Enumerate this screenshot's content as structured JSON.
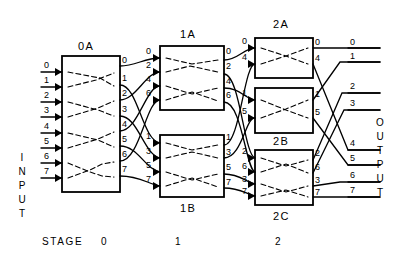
{
  "diagram": {
    "title_labels": {
      "input_word": "INPUT",
      "output_word": "OUTPUT",
      "stage_word": "STAGE"
    },
    "stage_numbers": [
      "0",
      "1",
      "2"
    ],
    "input_ports": [
      "0",
      "1",
      "2",
      "3",
      "4",
      "5",
      "6",
      "7"
    ],
    "output_ports": [
      "0",
      "1",
      "2",
      "3",
      "4",
      "5",
      "6",
      "7"
    ],
    "switches": [
      {
        "name": "0A",
        "label_position": "top",
        "stage": 0,
        "in_labels": [
          "0",
          "1",
          "2",
          "3",
          "4",
          "5",
          "6",
          "7"
        ],
        "out_labels": [
          "0",
          "1",
          "2",
          "3",
          "4",
          "5",
          "6",
          "7"
        ]
      },
      {
        "name": "1A",
        "label_position": "top",
        "stage": 1,
        "in_labels": [
          "0",
          "2",
          "4",
          "6"
        ],
        "out_labels": [
          "0",
          "2",
          "4",
          "6"
        ]
      },
      {
        "name": "1B",
        "label_position": "bottom",
        "stage": 1,
        "in_labels": [
          "1",
          "3",
          "5",
          "7"
        ],
        "out_labels": [
          "1",
          "3",
          "5",
          "7"
        ]
      },
      {
        "name": "2A",
        "label_position": "top",
        "stage": 2,
        "in_labels": [
          "0",
          "4"
        ],
        "out_labels": [
          "0",
          "4"
        ]
      },
      {
        "name": "2B",
        "label_position": "bottom",
        "stage": 2,
        "in_labels": [
          "1",
          "5"
        ],
        "out_labels": [
          "1",
          "5"
        ]
      },
      {
        "name": "2C",
        "label_position": "bottom",
        "stage": 2,
        "in_labels": [
          "2",
          "6",
          "3",
          "7"
        ],
        "out_labels": [
          "2",
          "6",
          "3",
          "7"
        ]
      }
    ],
    "colors": {
      "line": "#000000",
      "background": "#ffffff",
      "dashed": "#000000"
    }
  }
}
